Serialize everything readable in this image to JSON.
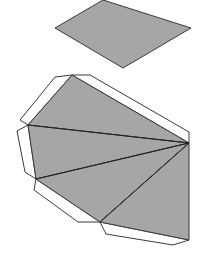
{
  "diagram": {
    "title": "",
    "colors": {
      "face": "#a6a6a6",
      "flap": "#ffffff",
      "stroke": "#3a3a3a"
    },
    "base": {
      "shape": "rhombus",
      "points": [
        [
          55,
          28
        ],
        [
          103,
          0
        ],
        [
          191,
          28
        ],
        [
          123,
          68
        ]
      ]
    },
    "apex": [
      189,
      143
    ],
    "fan_vertices": [
      [
        72,
        75
      ],
      [
        28,
        125
      ],
      [
        36,
        179
      ],
      [
        100,
        222
      ],
      [
        189,
        240
      ]
    ],
    "flaps": [
      [
        [
          72,
          75
        ],
        [
          55,
          77
        ],
        [
          28,
          125
        ],
        [
          28,
          125
        ]
      ],
      [
        [
          72,
          75
        ],
        [
          90,
          75
        ],
        [
          189,
          132
        ],
        [
          189,
          143
        ]
      ],
      [
        [
          28,
          125
        ],
        [
          18,
          131
        ],
        [
          27,
          172
        ],
        [
          36,
          179
        ]
      ],
      [
        [
          36,
          179
        ],
        [
          34,
          190
        ],
        [
          78,
          222
        ],
        [
          100,
          222
        ]
      ],
      [
        [
          100,
          222
        ],
        [
          106,
          234
        ],
        [
          173,
          245
        ],
        [
          189,
          240
        ]
      ]
    ]
  }
}
